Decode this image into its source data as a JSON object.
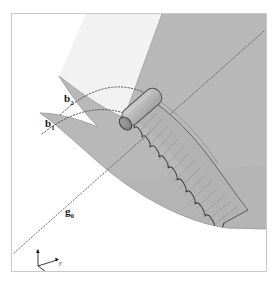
{
  "figure": {
    "frame": {
      "border_color": "#c9c9c9",
      "background": "#ffffff"
    },
    "surface": {
      "name": "curved-geodesic-surface",
      "fill": "#b8b8b8",
      "edge_color": "#9a9a9a",
      "description": "shaded curved 3D surface sheet"
    },
    "band": {
      "name": "wavy-striated-band",
      "fill": "#b2b2b2",
      "stroke": "#4a4a4a",
      "description": "scalloped band with transverse striations trailing from the tube"
    },
    "tube": {
      "name": "cylindrical-tube",
      "fill": "#bdbdbd",
      "cap_fill": "#8a8a8a",
      "stroke": "#5a5a5a"
    },
    "curves": {
      "b1": {
        "label": "b",
        "subscript": "1",
        "style": "dotted-arc",
        "color": "#555555"
      },
      "b2": {
        "label": "b",
        "subscript": "2",
        "style": "dotted-arc",
        "color": "#555555"
      },
      "g": {
        "label": "g",
        "subscript": "0",
        "style": "dotted-line",
        "color": "#555555"
      }
    },
    "labels": {
      "b2": {
        "base": "b",
        "sub": "2"
      },
      "b1": {
        "base": "b",
        "sub": "1"
      },
      "g": {
        "base": "g",
        "sub": "0"
      }
    },
    "axis_triad": {
      "name": "coordinate-axes",
      "color": "#1a1a1a",
      "axes": [
        {
          "id": "z",
          "label": "z",
          "direction": "up"
        },
        {
          "id": "y",
          "label": "y",
          "direction": "right"
        },
        {
          "id": "x",
          "label": "x",
          "direction": "down-right"
        }
      ]
    },
    "caption": {
      "number": "",
      "text": ""
    }
  }
}
